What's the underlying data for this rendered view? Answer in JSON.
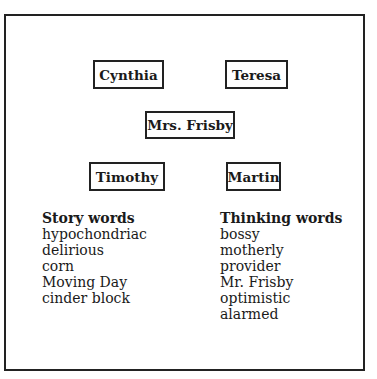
{
  "diagram": {
    "names": {
      "top_left": "Cynthia",
      "top_right": "Teresa",
      "center": "Mrs. Frisby",
      "bottom_left": "Timothy",
      "bottom_right": "Martin"
    }
  },
  "story_words": {
    "heading": "Story words",
    "items": [
      "hypochondriac",
      "delirious",
      "corn",
      "Moving Day",
      "cinder block"
    ]
  },
  "thinking_words": {
    "heading": "Thinking words",
    "items": [
      "bossy",
      "motherly",
      "provider",
      "Mr. Frisby",
      "optimistic",
      "alarmed"
    ]
  }
}
